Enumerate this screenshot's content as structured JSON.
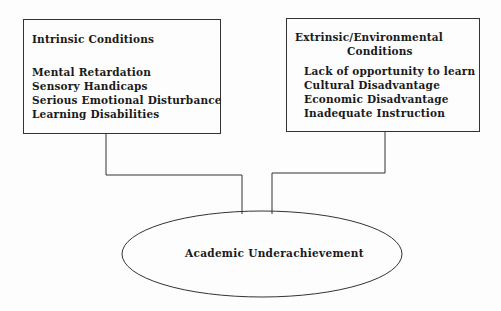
{
  "diagram": {
    "intrinsic_box": {
      "title": "Intrinsic Conditions",
      "items": [
        "Mental Retardation",
        "Sensory Handicaps",
        "Serious Emotional Disturbance",
        "Learning Disabilities"
      ]
    },
    "extrinsic_box": {
      "title_line1": "Extrinsic/Environmental",
      "title_line2": "Conditions",
      "items": [
        "Lack of opportunity to learn",
        "Cultural Disadvantage",
        "Economic Disadvantage",
        "Inadequate Instruction"
      ]
    },
    "outcome": {
      "label": "Academic Underachievement"
    },
    "colors": {
      "line": "#333333",
      "text": "#1a1a1a",
      "background": "#fdfdfd"
    }
  }
}
